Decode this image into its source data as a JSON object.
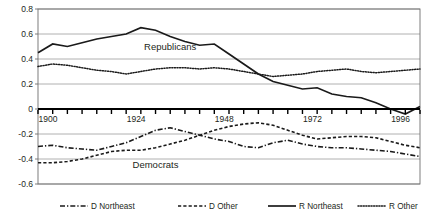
{
  "chart_data": {
    "type": "line",
    "title": "",
    "xlabel": "",
    "ylabel": "",
    "xlim": [
      1900,
      2004
    ],
    "ylim": [
      -0.6,
      0.8
    ],
    "grid": true,
    "legend_position": "bottom",
    "yticks": [
      "0.8",
      "0.6",
      "0.4",
      "0.2",
      "0",
      "-0.2",
      "-0.4",
      "-0.6"
    ],
    "ytick_values": [
      0.8,
      0.6,
      0.4,
      0.2,
      0,
      -0.2,
      -0.4,
      -0.6
    ],
    "xticks": [
      "1900",
      "1924",
      "1948",
      "1972",
      "1996"
    ],
    "xtick_values": [
      1900,
      1924,
      1948,
      1972,
      1996
    ],
    "x": [
      1900,
      1904,
      1908,
      1912,
      1916,
      1920,
      1924,
      1928,
      1932,
      1936,
      1940,
      1944,
      1948,
      1952,
      1956,
      1960,
      1964,
      1968,
      1972,
      1976,
      1980,
      1984,
      1988,
      1992,
      1996,
      2000,
      2004
    ],
    "annotations": [
      {
        "text": "Republicans",
        "x": 1936,
        "y": 0.47
      },
      {
        "text": "Democrats",
        "x": 1932,
        "y": -0.47
      }
    ],
    "series": [
      {
        "name": "R Northeast",
        "style": "solid",
        "values": [
          0.45,
          0.52,
          0.5,
          0.53,
          0.56,
          0.58,
          0.6,
          0.65,
          0.63,
          0.58,
          0.54,
          0.51,
          0.52,
          0.44,
          0.36,
          0.28,
          0.22,
          0.19,
          0.16,
          0.17,
          0.12,
          0.1,
          0.09,
          0.05,
          0.0,
          -0.04,
          0.02
        ]
      },
      {
        "name": "R Other",
        "style": "dotted",
        "values": [
          0.34,
          0.36,
          0.35,
          0.33,
          0.31,
          0.3,
          0.28,
          0.3,
          0.32,
          0.33,
          0.33,
          0.32,
          0.33,
          0.32,
          0.3,
          0.28,
          0.26,
          0.27,
          0.28,
          0.3,
          0.31,
          0.32,
          0.3,
          0.29,
          0.3,
          0.31,
          0.32
        ]
      },
      {
        "name": "D Northeast",
        "style": "dash-dot",
        "values": [
          -0.3,
          -0.29,
          -0.31,
          -0.32,
          -0.33,
          -0.3,
          -0.27,
          -0.22,
          -0.17,
          -0.15,
          -0.18,
          -0.21,
          -0.24,
          -0.26,
          -0.3,
          -0.31,
          -0.27,
          -0.25,
          -0.28,
          -0.3,
          -0.31,
          -0.31,
          -0.32,
          -0.33,
          -0.34,
          -0.36,
          -0.38
        ]
      },
      {
        "name": "D Other",
        "style": "dashed",
        "values": [
          -0.43,
          -0.43,
          -0.42,
          -0.4,
          -0.37,
          -0.34,
          -0.33,
          -0.33,
          -0.31,
          -0.28,
          -0.25,
          -0.21,
          -0.17,
          -0.14,
          -0.12,
          -0.11,
          -0.13,
          -0.17,
          -0.21,
          -0.24,
          -0.23,
          -0.22,
          -0.22,
          -0.23,
          -0.26,
          -0.29,
          -0.31
        ]
      }
    ]
  },
  "legend": {
    "items": [
      {
        "label": "D Northeast",
        "style": "dash-dot"
      },
      {
        "label": "D Other",
        "style": "dashed"
      },
      {
        "label": "R Northeast",
        "style": "solid"
      },
      {
        "label": "R Other",
        "style": "dotted"
      }
    ]
  }
}
